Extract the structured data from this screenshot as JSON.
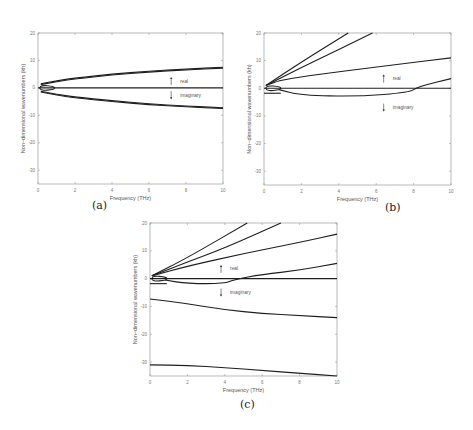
{
  "figure": {
    "captions": [
      "(a)",
      "(b)",
      "(c)"
    ]
  },
  "chart_data": [
    {
      "type": "line",
      "panel": "(a)",
      "xlabel": "Frequency (THz)",
      "ylabel": "Non−dimensional wavenumbers (kh)",
      "xlim": [
        0,
        10
      ],
      "ylim": [
        -35,
        20
      ],
      "xticks": [
        0,
        2,
        4,
        6,
        8,
        10
      ],
      "yticks": [
        20,
        10,
        0,
        -10,
        -20,
        -30
      ],
      "annotations": [
        {
          "text": "real",
          "arrow": "up",
          "x": 7.2,
          "y": 2.5
        },
        {
          "text": "imaginary",
          "arrow": "down",
          "x": 7.2,
          "y": -2.7
        }
      ],
      "series": [
        {
          "name": "real upper",
          "x": [
            0.15,
            1,
            2,
            4,
            6,
            8,
            10
          ],
          "y": [
            1.5,
            2.6,
            3.6,
            5.0,
            6.1,
            6.9,
            7.5
          ]
        },
        {
          "name": "real upper (outer)",
          "x": [
            0.15,
            1,
            2,
            4,
            6,
            8,
            10
          ],
          "y": [
            1.2,
            2.3,
            3.3,
            4.7,
            5.8,
            6.6,
            7.2
          ]
        },
        {
          "name": "imaginary lower",
          "x": [
            0.15,
            1,
            2,
            4,
            6,
            8,
            10
          ],
          "y": [
            -1.5,
            -2.6,
            -3.6,
            -5.0,
            -6.1,
            -6.9,
            -7.5
          ]
        },
        {
          "name": "imaginary lower (outer)",
          "x": [
            0.15,
            1,
            2,
            4,
            6,
            8,
            10
          ],
          "y": [
            -1.2,
            -2.3,
            -3.3,
            -4.7,
            -5.8,
            -6.6,
            -7.2
          ]
        },
        {
          "name": "zero",
          "x": [
            0,
            10
          ],
          "y": [
            0,
            0
          ]
        },
        {
          "name": "loop",
          "x": [
            0.1,
            0.3,
            0.9,
            0.3,
            0.1
          ],
          "y": [
            0,
            1.2,
            0,
            -1.2,
            0
          ]
        }
      ]
    },
    {
      "type": "line",
      "panel": "(b)",
      "xlabel": "Frequency (THz)",
      "ylabel": "Non−dimensional wavenumbers (kh)",
      "xlim": [
        0,
        10
      ],
      "ylim": [
        -35,
        20
      ],
      "xticks": [
        0,
        2,
        4,
        6,
        8,
        10
      ],
      "yticks": [
        20,
        10,
        0,
        -10,
        -20,
        -30
      ],
      "annotations": [
        {
          "text": "real",
          "arrow": "up",
          "x": 6.4,
          "y": 3.5
        },
        {
          "text": "imaginary",
          "arrow": "down",
          "x": 6.4,
          "y": -7
        }
      ],
      "series": [
        {
          "name": "mode 1",
          "x": [
            0.1,
            2,
            4.5
          ],
          "y": [
            1,
            9.5,
            20
          ]
        },
        {
          "name": "mode 2",
          "x": [
            0.1,
            2,
            4,
            5.8
          ],
          "y": [
            1,
            7.5,
            14,
            20
          ]
        },
        {
          "name": "mode 3",
          "x": [
            0.1,
            1,
            4,
            7,
            10
          ],
          "y": [
            1,
            3.2,
            6,
            8.5,
            11
          ]
        },
        {
          "name": "mode 4",
          "x": [
            0.8,
            2,
            5,
            7.8,
            8.2,
            10
          ],
          "y": [
            -0.5,
            -2.5,
            -3.0,
            -1.5,
            0.5,
            3.5
          ]
        },
        {
          "name": "zero",
          "x": [
            0,
            10
          ],
          "y": [
            0,
            0
          ]
        },
        {
          "name": "short imag",
          "x": [
            0,
            0.9
          ],
          "y": [
            -1.8,
            -1.8
          ]
        },
        {
          "name": "loop",
          "x": [
            0.1,
            0.3,
            0.9,
            0.3,
            0.1
          ],
          "y": [
            0,
            1.2,
            0,
            -1.2,
            0
          ]
        }
      ]
    },
    {
      "type": "line",
      "panel": "(c)",
      "xlabel": "Frequency (THz)",
      "ylabel": "Non−dimensional wavenumbers (kh)",
      "xlim": [
        0,
        10
      ],
      "ylim": [
        -35,
        20
      ],
      "xticks": [
        0,
        2,
        4,
        6,
        8,
        10
      ],
      "yticks": [
        20,
        10,
        0,
        -10,
        -20,
        -30
      ],
      "annotations": [
        {
          "text": "real",
          "arrow": "up",
          "x": 3.8,
          "y": 3.5
        },
        {
          "text": "imaginary",
          "arrow": "down",
          "x": 3.8,
          "y": -5
        }
      ],
      "series": [
        {
          "name": "mode 1",
          "x": [
            0.1,
            2,
            5.2
          ],
          "y": [
            1,
            7.5,
            20
          ]
        },
        {
          "name": "mode 2",
          "x": [
            0.1,
            2,
            4,
            7
          ],
          "y": [
            1,
            6,
            11,
            20
          ]
        },
        {
          "name": "mode 3",
          "x": [
            0.1,
            2,
            5,
            8,
            10
          ],
          "y": [
            1,
            4.5,
            9,
            13,
            16
          ]
        },
        {
          "name": "mode 4",
          "x": [
            0.8,
            2,
            4,
            4.5,
            6,
            8,
            10
          ],
          "y": [
            -0.5,
            -1.8,
            -1.8,
            -0.3,
            1.5,
            3,
            5.5
          ]
        },
        {
          "name": "zero",
          "x": [
            0,
            10
          ],
          "y": [
            0,
            0
          ]
        },
        {
          "name": "imag 1",
          "x": [
            0,
            2,
            4,
            6,
            8,
            10
          ],
          "y": [
            -7.3,
            -9,
            -11.2,
            -12.5,
            -13.3,
            -14
          ]
        },
        {
          "name": "imag 2",
          "x": [
            0,
            2,
            4,
            6,
            8,
            10
          ],
          "y": [
            -31,
            -31.2,
            -32,
            -33,
            -34,
            -35
          ]
        },
        {
          "name": "short imag",
          "x": [
            0,
            0.9
          ],
          "y": [
            -1.8,
            -1.8
          ]
        },
        {
          "name": "loop",
          "x": [
            0.1,
            0.3,
            0.9,
            0.3,
            0.1
          ],
          "y": [
            0,
            1.2,
            0,
            -1.2,
            0
          ]
        }
      ]
    }
  ]
}
